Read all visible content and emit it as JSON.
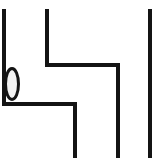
{
  "canvas": {
    "width": 155,
    "height": 165,
    "background_color": "#ffffff",
    "title": "Line Diagram"
  },
  "style": {
    "stroke_color": "#141414",
    "stroke_width": 4,
    "ellipse_stroke_color": "#141414",
    "ellipse_stroke_width": 3,
    "ellipse_fill_color": "#f2f2f2"
  },
  "shapes": {
    "left_path": {
      "name": "left-stepped-path",
      "points": "4,9 4,104 75,104 75,158"
    },
    "middle_path": {
      "name": "middle-stepped-path",
      "points": "47,9 47,65 118,65 118,158"
    },
    "right_line": {
      "name": "right-vertical-line",
      "x1": 150,
      "y1": 9,
      "x2": 150,
      "y2": 158
    },
    "ellipse": {
      "name": "callout-ellipse",
      "cx": 12,
      "cy": 84,
      "rx": 6.5,
      "ry": 15.5
    }
  }
}
